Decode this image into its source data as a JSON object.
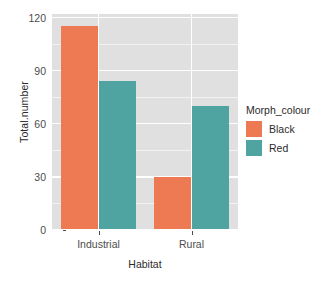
{
  "chart_data": {
    "type": "bar",
    "title": "",
    "subtitle": "",
    "xlabel": "Habitat",
    "ylabel": "Total.number",
    "categories": [
      "Industrial",
      "Rural"
    ],
    "series": [
      {
        "name": "Black",
        "color": "#ED7A53",
        "values": [
          115,
          30
        ]
      },
      {
        "name": "Red",
        "color": "#4FA3A0",
        "values": [
          84,
          70
        ]
      }
    ],
    "legend": {
      "title": "Morph_colour",
      "position": "right",
      "entries": [
        "Black",
        "Red"
      ]
    },
    "yaxis": {
      "ticks": [
        0,
        30,
        60,
        90,
        120
      ],
      "tick_labels": [
        "0",
        "30",
        "60",
        "90",
        "120"
      ],
      "ylim": [
        0,
        122
      ],
      "minor_ticks": [
        15,
        45,
        75,
        105
      ]
    },
    "xaxis": {
      "tick_labels": [
        "Industrial",
        "Rural"
      ]
    },
    "grid": {
      "enabled": true,
      "panel_background": "#e0e0e0",
      "major_color": "#ffffff",
      "minor_color": "#f2f2f2"
    }
  }
}
